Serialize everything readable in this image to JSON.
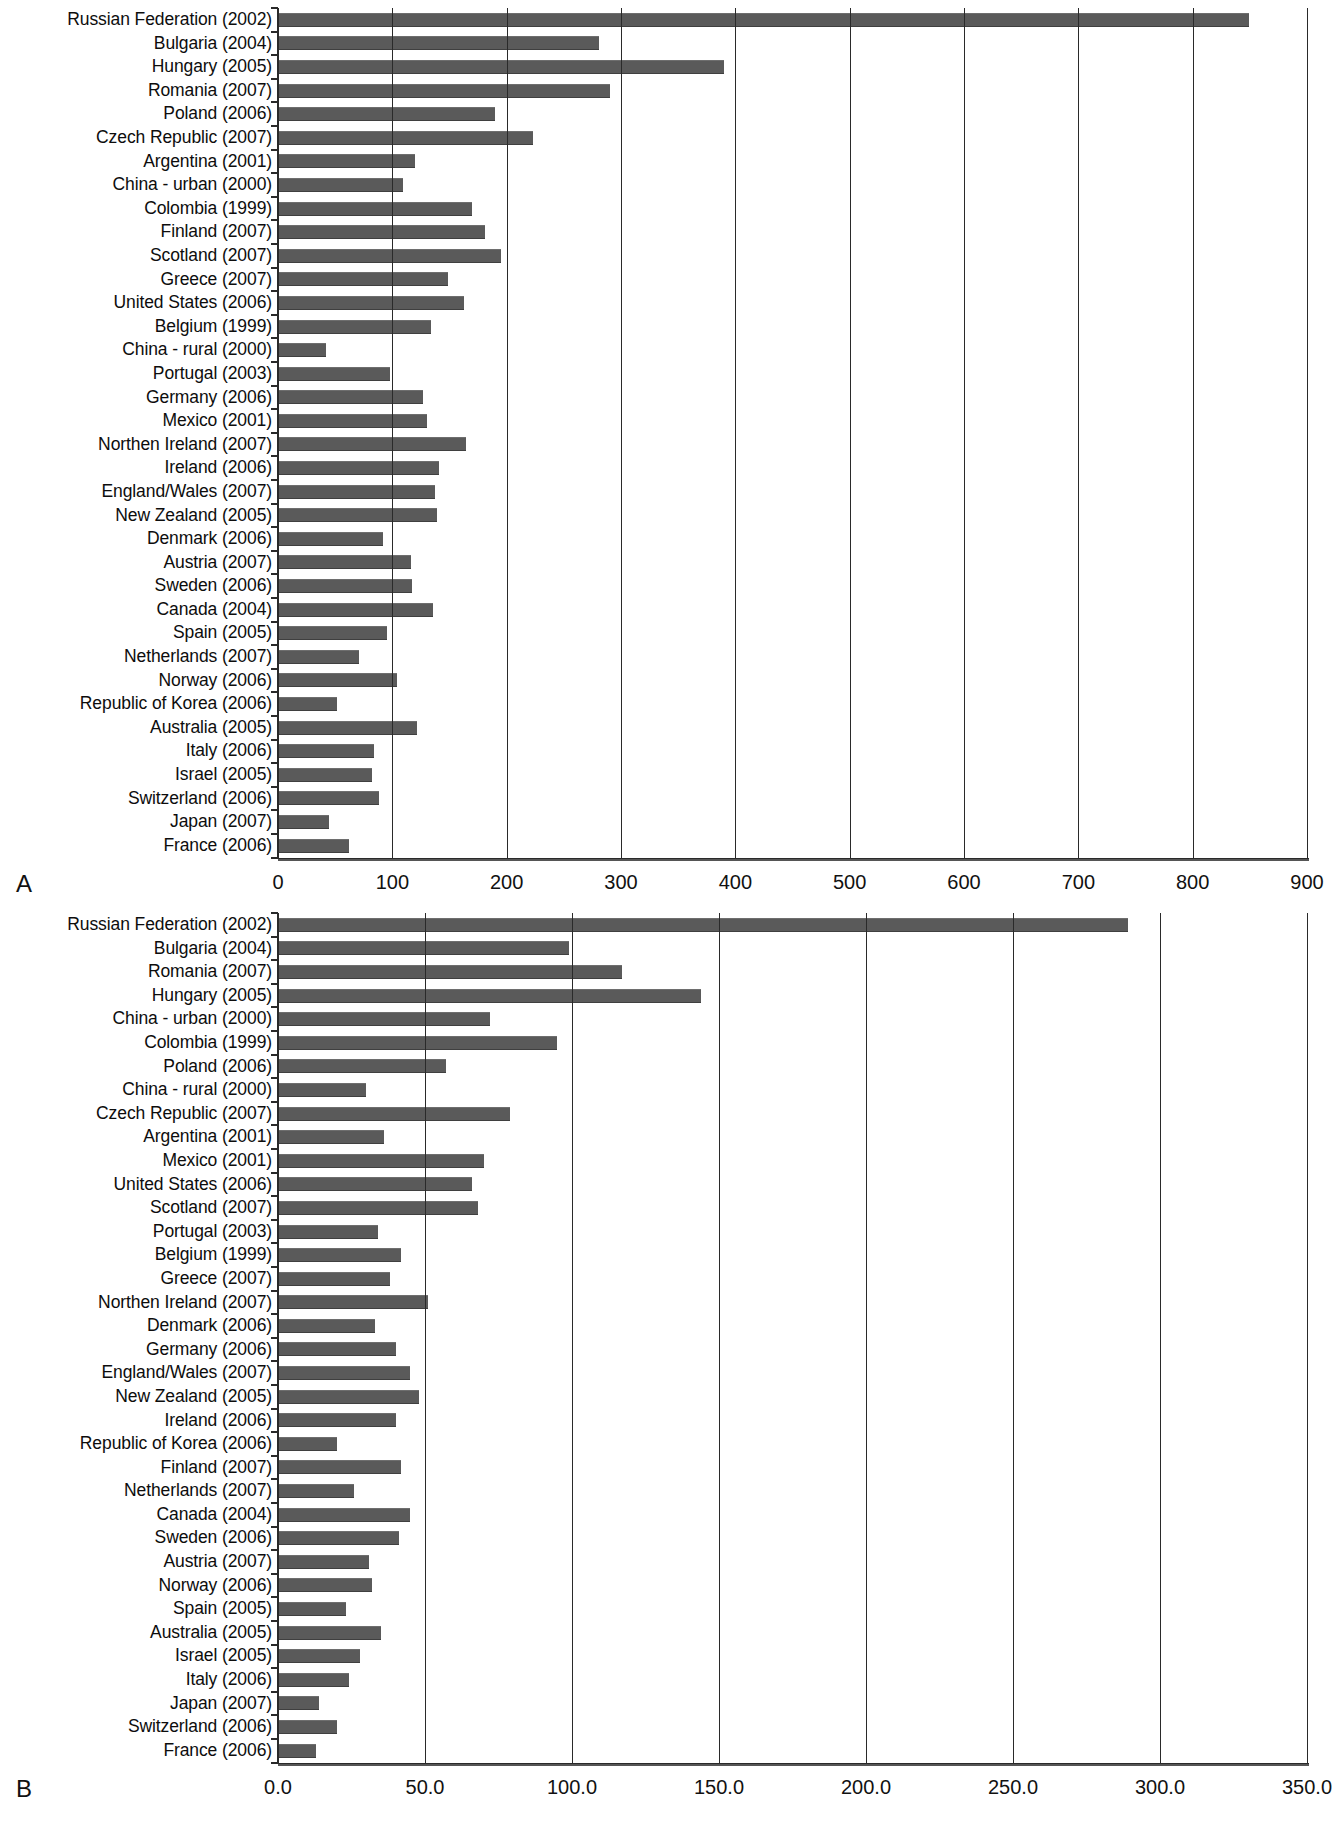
{
  "figure": {
    "panel_a_letter": "A",
    "panel_b_letter": "B"
  },
  "chart_data": [
    {
      "id": "panel-a",
      "type": "bar",
      "orientation": "horizontal",
      "title": "",
      "xlabel": "",
      "ylabel": "",
      "xlim": [
        0,
        900
      ],
      "xticks": [
        0,
        100,
        200,
        300,
        400,
        500,
        600,
        700,
        800,
        900
      ],
      "xticklabels": [
        "0",
        "100",
        "200",
        "300",
        "400",
        "500",
        "600",
        "700",
        "800",
        "900"
      ],
      "grid": true,
      "legend": "none",
      "bar_color": "#5a5a5a",
      "panel_letter": "A",
      "categories": [
        "Russian Federation (2002)",
        "Bulgaria (2004)",
        "Hungary (2005)",
        "Romania (2007)",
        "Poland (2006)",
        "Czech Republic (2007)",
        "Argentina (2001)",
        "China - urban (2000)",
        "Colombia (1999)",
        "Finland (2007)",
        "Scotland (2007)",
        "Greece (2007)",
        "United States (2006)",
        "Belgium (1999)",
        "China - rural (2000)",
        "Portugal (2003)",
        "Germany (2006)",
        "Mexico (2001)",
        "Northen Ireland (2007)",
        "Ireland (2006)",
        "England/Wales (2007)",
        "New Zealand (2005)",
        "Denmark (2006)",
        "Austria (2007)",
        "Sweden (2006)",
        "Canada (2004)",
        "Spain (2005)",
        "Netherlands (2007)",
        "Norway (2006)",
        "Republic of Korea (2006)",
        "Australia (2005)",
        "Italy (2006)",
        "Israel (2005)",
        "Switzerland (2006)",
        "Japan (2007)",
        "France (2006)"
      ],
      "values": [
        849,
        281,
        390,
        290,
        190,
        223,
        120,
        109,
        170,
        181,
        195,
        149,
        163,
        134,
        42,
        98,
        127,
        130,
        164,
        141,
        137,
        139,
        92,
        116,
        117,
        136,
        95,
        71,
        104,
        52,
        122,
        84,
        82,
        88,
        45,
        62
      ]
    },
    {
      "id": "panel-b",
      "type": "bar",
      "orientation": "horizontal",
      "title": "",
      "xlabel": "",
      "ylabel": "",
      "xlim": [
        0,
        350
      ],
      "xticks": [
        0,
        50,
        100,
        150,
        200,
        250,
        300,
        350
      ],
      "xticklabels": [
        "0.0",
        "50.0",
        "100.0",
        "150.0",
        "200.0",
        "250.0",
        "300.0",
        "350.0"
      ],
      "grid": true,
      "legend": "none",
      "bar_color": "#5a5a5a",
      "panel_letter": "B",
      "categories": [
        "Russian Federation (2002)",
        "Bulgaria (2004)",
        "Romania (2007)",
        "Hungary (2005)",
        "China - urban (2000)",
        "Colombia (1999)",
        "Poland (2006)",
        "China - rural (2000)",
        "Czech Republic (2007)",
        "Argentina (2001)",
        "Mexico (2001)",
        "United States (2006)",
        "Scotland (2007)",
        "Portugal (2003)",
        "Belgium (1999)",
        "Greece (2007)",
        "Northen Ireland (2007)",
        "Denmark (2006)",
        "Germany (2006)",
        "England/Wales (2007)",
        "New Zealand (2005)",
        "Ireland (2006)",
        "Republic of Korea (2006)",
        "Finland (2007)",
        "Netherlands (2007)",
        "Canada (2004)",
        "Sweden (2006)",
        "Austria (2007)",
        "Norway (2006)",
        "Spain (2005)",
        "Australia (2005)",
        "Israel (2005)",
        "Italy (2006)",
        "Japan (2007)",
        "Switzerland (2006)",
        "France (2006)"
      ],
      "values": [
        289,
        99,
        117,
        144,
        72,
        95,
        57,
        30,
        79,
        36,
        70,
        66,
        68,
        34,
        42,
        38,
        51,
        33,
        40,
        45,
        48,
        40,
        20,
        42,
        26,
        45,
        41,
        31,
        32,
        23,
        35,
        28,
        24,
        14,
        20,
        13
      ]
    }
  ]
}
